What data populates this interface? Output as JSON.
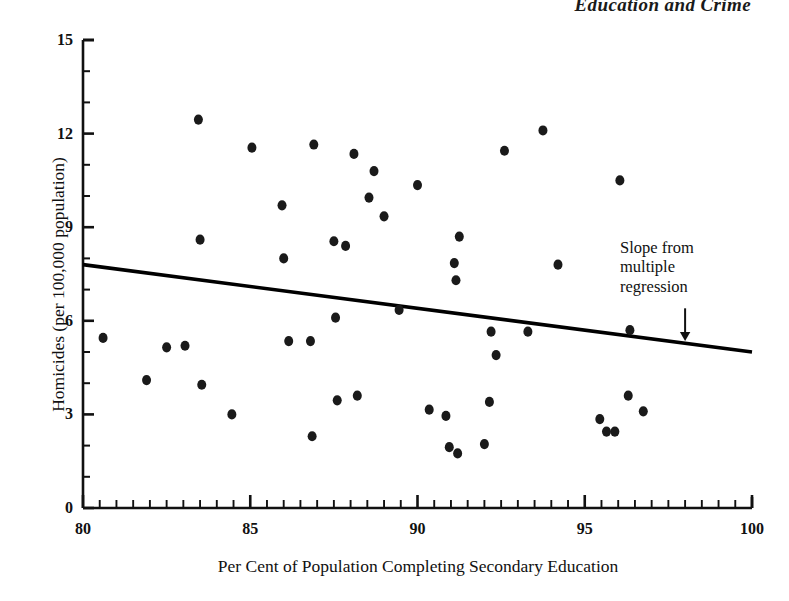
{
  "running_head": "Education and Crime",
  "chart_data": {
    "type": "scatter",
    "title": "",
    "xlabel": "Per Cent of Population Completing Secondary Education",
    "ylabel": "Homicides (per 100,000 population)",
    "xlim": [
      80,
      100
    ],
    "ylim": [
      0,
      15
    ],
    "x_ticks_major": [
      80,
      85,
      90,
      95,
      100
    ],
    "x_tick_labels": [
      "80",
      "85",
      "90",
      "95",
      "100"
    ],
    "x_minor_step": 0.5,
    "y_ticks_major": [
      0,
      3,
      6,
      9,
      12,
      15
    ],
    "y_tick_labels": [
      "0",
      "3",
      "6",
      "9",
      "12",
      "15"
    ],
    "y_minor_step": 1,
    "grid": false,
    "legend": false,
    "marker": "filled-circle",
    "marker_color": "#1a1a1a",
    "marker_size_px": 9,
    "points": [
      {
        "x": 80.6,
        "y": 5.45
      },
      {
        "x": 81.9,
        "y": 4.1
      },
      {
        "x": 82.5,
        "y": 5.15
      },
      {
        "x": 83.05,
        "y": 5.2
      },
      {
        "x": 83.45,
        "y": 12.45
      },
      {
        "x": 83.5,
        "y": 8.6
      },
      {
        "x": 83.55,
        "y": 3.95
      },
      {
        "x": 84.45,
        "y": 3.0
      },
      {
        "x": 85.05,
        "y": 11.55
      },
      {
        "x": 85.95,
        "y": 9.7
      },
      {
        "x": 86.0,
        "y": 8.0
      },
      {
        "x": 86.15,
        "y": 5.35
      },
      {
        "x": 86.8,
        "y": 5.35
      },
      {
        "x": 86.85,
        "y": 2.3
      },
      {
        "x": 86.9,
        "y": 11.65
      },
      {
        "x": 87.5,
        "y": 8.55
      },
      {
        "x": 87.55,
        "y": 6.1
      },
      {
        "x": 87.6,
        "y": 3.45
      },
      {
        "x": 87.85,
        "y": 8.4
      },
      {
        "x": 88.1,
        "y": 11.35
      },
      {
        "x": 88.2,
        "y": 3.6
      },
      {
        "x": 88.55,
        "y": 9.95
      },
      {
        "x": 88.7,
        "y": 10.8
      },
      {
        "x": 89.0,
        "y": 9.35
      },
      {
        "x": 89.45,
        "y": 6.35
      },
      {
        "x": 90.0,
        "y": 10.35
      },
      {
        "x": 90.35,
        "y": 3.15
      },
      {
        "x": 90.85,
        "y": 2.95
      },
      {
        "x": 90.95,
        "y": 1.95
      },
      {
        "x": 91.1,
        "y": 7.85
      },
      {
        "x": 91.15,
        "y": 7.3
      },
      {
        "x": 91.2,
        "y": 1.75
      },
      {
        "x": 91.25,
        "y": 8.7
      },
      {
        "x": 92.0,
        "y": 2.05
      },
      {
        "x": 92.15,
        "y": 3.4
      },
      {
        "x": 92.2,
        "y": 5.65
      },
      {
        "x": 92.35,
        "y": 4.9
      },
      {
        "x": 92.6,
        "y": 11.45
      },
      {
        "x": 93.3,
        "y": 5.65
      },
      {
        "x": 93.75,
        "y": 12.1
      },
      {
        "x": 94.2,
        "y": 7.8
      },
      {
        "x": 95.45,
        "y": 2.85
      },
      {
        "x": 95.65,
        "y": 2.45
      },
      {
        "x": 95.9,
        "y": 2.45
      },
      {
        "x": 96.05,
        "y": 10.5
      },
      {
        "x": 96.3,
        "y": 3.6
      },
      {
        "x": 96.35,
        "y": 5.7
      },
      {
        "x": 96.75,
        "y": 3.1
      }
    ],
    "regression_line": {
      "name": "Slope from multiple regression",
      "x_start": 80,
      "y_start": 7.8,
      "x_end": 100,
      "y_end": 5.0,
      "color": "#000000",
      "width_px": 3.6
    },
    "annotations": [
      {
        "text": "Slope from\nmultiple\nregression",
        "arrow": "down-arrow",
        "arrow_x": 98.0,
        "arrow_y_top": 6.4,
        "arrow_y_bottom": 5.35
      }
    ]
  }
}
